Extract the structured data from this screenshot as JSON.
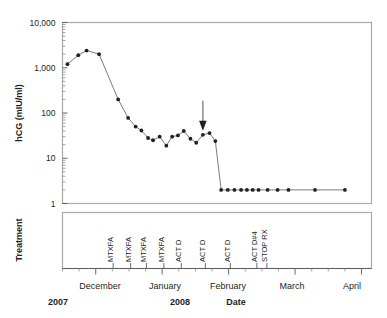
{
  "figure": {
    "width": 387,
    "height": 318,
    "background": "#ffffff",
    "ink_color": "#231f20",
    "frame_color": "#a7a9ac"
  },
  "chart_data": {
    "type": "line",
    "title": "",
    "xlabel": "Date",
    "ylabel": "hCG (mIU/ml)",
    "yscale": "log",
    "ylim": [
      1,
      10000
    ],
    "ytick_labels": [
      "10,000",
      "1,000",
      "100",
      "10",
      "1"
    ],
    "ytick_values": [
      10000,
      1000,
      100,
      10,
      1
    ],
    "grid": false,
    "legend": null,
    "xtick_labels": [
      "December",
      "January",
      "February",
      "March",
      "April"
    ],
    "x_year_labels": [
      {
        "text": "2007",
        "under": "December"
      },
      {
        "text": "2008",
        "under": "January"
      }
    ],
    "x_axis_caption": "Date",
    "series": [
      {
        "name": "hCG",
        "marker": "filled-circle",
        "x": [
          0.3,
          0.95,
          1.45,
          2.2,
          3.35,
          3.95,
          4.4,
          4.75,
          5.15,
          5.45,
          5.85,
          6.25,
          6.6,
          6.95,
          7.3,
          7.7,
          8.05,
          8.45,
          8.85,
          9.2,
          9.55,
          9.95,
          10.35,
          10.75,
          11.1,
          11.45,
          11.8,
          12.35,
          12.95,
          13.6,
          15.2,
          17.0
        ],
        "values": [
          1200,
          1900,
          2400,
          2000,
          200,
          78,
          50,
          41,
          28,
          25,
          30,
          19,
          30,
          32,
          40,
          27,
          22,
          33,
          36,
          24,
          2,
          2,
          2,
          2,
          2,
          2,
          2,
          2,
          2,
          2,
          2,
          2
        ]
      }
    ],
    "annotations": [
      {
        "type": "arrow",
        "direction": "down",
        "x_weeks": 8.45,
        "points_to_value": 33,
        "color": "#808285"
      }
    ]
  },
  "y_axis": {
    "title": "hCG (mIU/ml)"
  },
  "treatment_panel": {
    "title": "Treatment",
    "events": [
      {
        "label": "MTXFA",
        "x_weeks": 3.05
      },
      {
        "label": "MTXFA",
        "x_weeks": 4.1
      },
      {
        "label": "MTXFA",
        "x_weeks": 5.05
      },
      {
        "label": "MTXFA",
        "x_weeks": 6.1
      },
      {
        "label": "ACT D",
        "x_weeks": 7.15
      },
      {
        "label": "ACT D",
        "x_weeks": 8.6
      },
      {
        "label": "ACT D",
        "x_weeks": 10.1
      },
      {
        "label": "ACT D#4",
        "x_weeks": 11.7
      },
      {
        "label": "STOP RX",
        "x_weeks": 12.3
      }
    ]
  }
}
